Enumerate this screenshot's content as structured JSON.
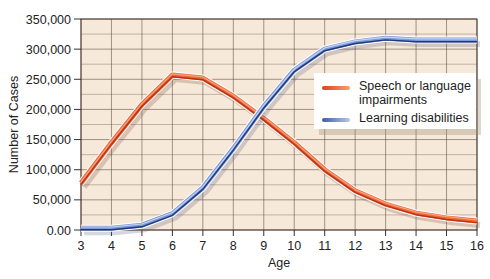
{
  "chart_data": {
    "type": "line",
    "title": "",
    "xlabel": "Age",
    "ylabel": "Number of Cases",
    "x": [
      3,
      4,
      5,
      6,
      7,
      8,
      9,
      10,
      11,
      12,
      13,
      14,
      15,
      16
    ],
    "x_tick_labels": [
      "3",
      "4",
      "5",
      "6",
      "7",
      "8",
      "9",
      "10",
      "11",
      "12",
      "13",
      "14",
      "15",
      "16"
    ],
    "y_tick_values": [
      0,
      50000,
      100000,
      150000,
      200000,
      250000,
      300000,
      350000
    ],
    "y_tick_labels": [
      "0.00",
      "50,000",
      "100,000",
      "150,000",
      "200,000",
      "250,000",
      "300,000",
      "350,000"
    ],
    "xlim": [
      3,
      16
    ],
    "ylim": [
      0,
      350000
    ],
    "grid": true,
    "legend_position": "upper right (inside plot)",
    "series": [
      {
        "name": "Speech or language impairments",
        "color": "#e8502a",
        "values": [
          78000,
          145000,
          208000,
          257000,
          252000,
          222000,
          185000,
          145000,
          100000,
          65000,
          43000,
          28000,
          20000,
          15000
        ]
      },
      {
        "name": "Learning disabilities",
        "color": "#5a78c0",
        "values": [
          3000,
          3000,
          8000,
          27000,
          70000,
          135000,
          205000,
          265000,
          300000,
          312000,
          318000,
          315000,
          315000,
          315000
        ]
      }
    ]
  },
  "legend": {
    "items": [
      {
        "label_line1": "Speech or language",
        "label_line2": "impairments",
        "color": "#e8502a"
      },
      {
        "label_line1": "Learning disabilities",
        "label_line2": "",
        "color": "#6a86c8"
      }
    ]
  },
  "axes": {
    "xlabel": "Age",
    "ylabel": "Number of Cases"
  },
  "style": {
    "plot_bg": "#f7e9da",
    "grid_color": "#5a4a3e",
    "speech_color": "#e8502a",
    "speech_dark": "#b8321a",
    "learning_color": "#8aa6e0",
    "learning_dark": "#1f3a7a"
  }
}
